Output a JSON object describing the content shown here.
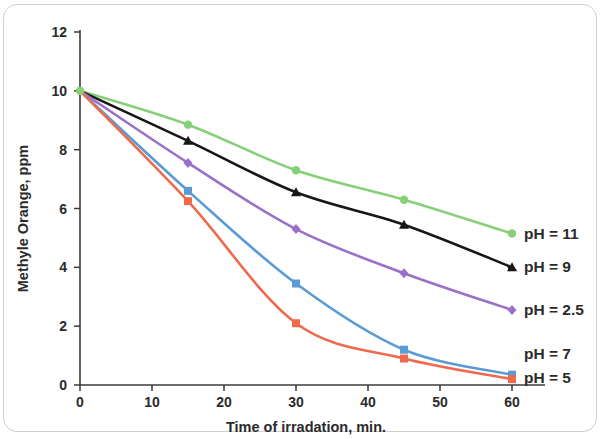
{
  "chart_data": {
    "type": "line",
    "title": "",
    "xlabel": "Time of irradation, min.",
    "ylabel": "Methyle Orange, ppm",
    "x": [
      0,
      15,
      30,
      45,
      60
    ],
    "xlim": [
      0,
      65
    ],
    "ylim": [
      0,
      12
    ],
    "xticks": [
      "0",
      "10",
      "20",
      "30",
      "40",
      "50",
      "60"
    ],
    "xtick_values": [
      0,
      10,
      20,
      30,
      40,
      50,
      60
    ],
    "yticks": [
      "0",
      "2",
      "4",
      "6",
      "8",
      "10",
      "12"
    ],
    "ytick_values": [
      0,
      2,
      4,
      6,
      8,
      10,
      12
    ],
    "grid": false,
    "legend_position": "right-inline-annotations",
    "series": [
      {
        "name": "pH = 11",
        "color": "#86d07a",
        "marker": "circle",
        "values": [
          10.0,
          8.85,
          7.3,
          6.3,
          5.15
        ]
      },
      {
        "name": "pH = 9",
        "color": "#171717",
        "marker": "triangle",
        "values": [
          10.0,
          8.3,
          6.55,
          5.45,
          4.0
        ]
      },
      {
        "name": "pH = 2.5",
        "color": "#9a70c8",
        "marker": "diamond",
        "values": [
          10.0,
          7.55,
          5.3,
          3.8,
          2.55
        ]
      },
      {
        "name": "pH = 7",
        "color": "#5b9bd5",
        "marker": "square",
        "values": [
          10.0,
          6.6,
          3.45,
          1.2,
          0.35
        ]
      },
      {
        "name": "pH = 5",
        "color": "#ef6a4c",
        "marker": "square",
        "values": [
          10.0,
          6.25,
          2.1,
          0.9,
          0.2
        ]
      }
    ],
    "annotations": [
      {
        "text": "pH = 11",
        "x": 60,
        "y": 5.15
      },
      {
        "text": "pH = 9",
        "x": 60,
        "y": 4.0
      },
      {
        "text": "pH = 2.5",
        "x": 60,
        "y": 2.55
      },
      {
        "text": "pH = 7",
        "x": 60,
        "y": 1.05
      },
      {
        "text": "pH = 5",
        "x": 60,
        "y": 0.25
      }
    ]
  },
  "figure": {
    "border_color": "#cfcfcf",
    "background": "#ffffff",
    "axis_color": "#3b3b3b"
  }
}
